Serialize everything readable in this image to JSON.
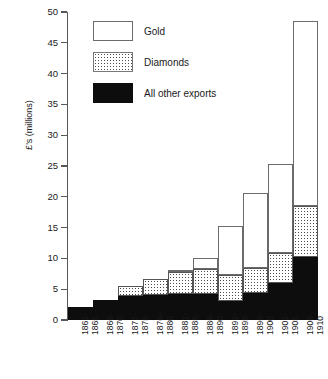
{
  "chart_data": {
    "type": "bar",
    "stacked": true,
    "title": "",
    "xlabel": "",
    "ylabel": "£'s (millions)",
    "ylim": [
      0,
      50
    ],
    "yticks": [
      0,
      5,
      10,
      15,
      20,
      25,
      30,
      35,
      40,
      45,
      50
    ],
    "ytick_labels": [
      "0",
      "5",
      "10",
      "15",
      "20",
      "25",
      "30",
      "35",
      "40",
      "45",
      "50"
    ],
    "grid": false,
    "legend_position": "upper-left-inside",
    "categories": [
      "1861-1865",
      "1866-1870",
      "1871-1875",
      "1876-1880",
      "1881-1885",
      "1886-1890",
      "1891-1895",
      "1896-1900",
      "1901-1905",
      "1906-1910"
    ],
    "category_lines": [
      [
        "1861-",
        "1865"
      ],
      [
        "1866-",
        "1870"
      ],
      [
        "1871-",
        "1875"
      ],
      [
        "1876-",
        "1880"
      ],
      [
        "1881-",
        "1885"
      ],
      [
        "1886-",
        "1890"
      ],
      [
        "1891-",
        "1895"
      ],
      [
        "1896-",
        "1900"
      ],
      [
        "1901-",
        "1905"
      ],
      [
        "1906-",
        "1910"
      ]
    ],
    "series": [
      {
        "name": "All other exports",
        "key": "other",
        "color": "#0d0d0d",
        "pattern": "solid-black",
        "values": [
          2.1,
          3.2,
          3.9,
          4.0,
          4.2,
          4.3,
          3.1,
          4.4,
          6.0,
          10.3
        ]
      },
      {
        "name": "Diamonds",
        "key": "diamonds",
        "color": "#ffffff",
        "pattern": "stippled",
        "values": [
          0.0,
          0.0,
          1.6,
          2.7,
          3.6,
          4.0,
          4.2,
          4.0,
          4.8,
          8.2
        ]
      },
      {
        "name": "Gold",
        "key": "gold",
        "color": "#ffffff",
        "pattern": "open",
        "values": [
          0.0,
          0.0,
          0.0,
          0.0,
          0.4,
          1.8,
          8.0,
          12.2,
          14.6,
          30.0
        ]
      }
    ],
    "totals": [
      2.1,
      3.2,
      5.5,
      6.7,
      8.2,
      10.1,
      15.3,
      20.6,
      25.4,
      48.5
    ]
  },
  "legend": {
    "entries": [
      {
        "label": "Gold",
        "swatch": "open-white-box"
      },
      {
        "label": "Diamonds",
        "swatch": "stippled-box"
      },
      {
        "label": "All other exports",
        "swatch": "solid-black-box"
      }
    ]
  }
}
